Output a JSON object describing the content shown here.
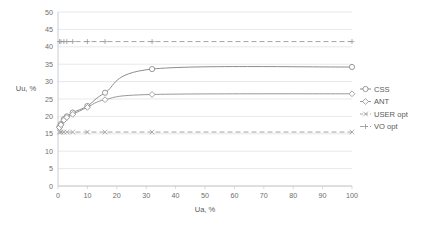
{
  "chart_data": {
    "type": "line",
    "title": "",
    "xlabel": "Ua, %",
    "ylabel": "Uu, %",
    "xlim": [
      0,
      100
    ],
    "ylim": [
      0,
      50
    ],
    "xticks": [
      0,
      10,
      20,
      30,
      40,
      50,
      60,
      70,
      80,
      90,
      100
    ],
    "yticks": [
      0,
      5,
      10,
      15,
      20,
      25,
      30,
      35,
      40,
      45,
      50
    ],
    "grid": "horizontal",
    "legend_position": "right",
    "series": [
      {
        "name": "CSS",
        "marker": "circle",
        "linestyle": "solid",
        "color": "#808080",
        "x": [
          0.5,
          1,
          2,
          3,
          5,
          10,
          16,
          32,
          100
        ],
        "y": [
          17.0,
          17.8,
          19.2,
          20.0,
          21.1,
          23.0,
          26.8,
          33.6,
          34.2
        ]
      },
      {
        "name": "ANT",
        "marker": "diamond",
        "linestyle": "solid",
        "color": "#8c8c8c",
        "x": [
          0.5,
          1,
          2,
          3,
          5,
          10,
          16,
          32,
          100
        ],
        "y": [
          16.8,
          17.6,
          18.9,
          19.7,
          20.6,
          22.6,
          24.8,
          26.3,
          26.5
        ]
      },
      {
        "name": "USER opt",
        "marker": "x",
        "linestyle": "dashed",
        "color": "#9a9a9a",
        "x": [
          0.5,
          1,
          2,
          3,
          5,
          10,
          16,
          32,
          100
        ],
        "y": [
          15.5,
          15.5,
          15.5,
          15.5,
          15.5,
          15.5,
          15.5,
          15.5,
          15.5
        ]
      },
      {
        "name": "VO opt",
        "marker": "plus",
        "linestyle": "dashed",
        "color": "#9a9a9a",
        "x": [
          0.5,
          1,
          2,
          3,
          5,
          10,
          16,
          32,
          100
        ],
        "y": [
          41.5,
          41.5,
          41.5,
          41.5,
          41.5,
          41.5,
          41.5,
          41.5,
          41.5
        ]
      }
    ]
  },
  "legend": {
    "items": [
      {
        "label": "CSS"
      },
      {
        "label": "ANT"
      },
      {
        "label": "USER opt"
      },
      {
        "label": "VO opt"
      }
    ]
  },
  "axes": {
    "x_title": "Ua, %",
    "y_title": "Uu, %"
  },
  "colors": {
    "grid": "#d9d9d9",
    "axis": "#bfbfbf",
    "text": "#6e6e6e",
    "series_css": "#808080",
    "series_ant": "#8c8c8c",
    "series_user": "#9a9a9a",
    "series_vo": "#9a9a9a"
  }
}
